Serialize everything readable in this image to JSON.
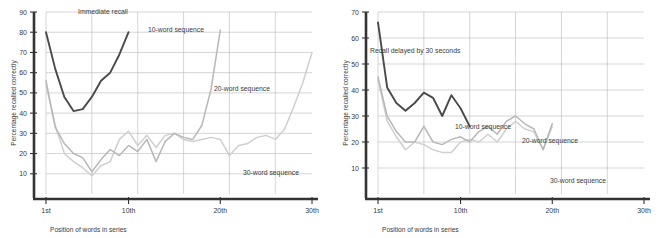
{
  "figure": {
    "background_color": "#ffffff",
    "grid_color": "#b9b9b9",
    "axis_color": "#333333",
    "text_color": "#3b3b3b"
  },
  "series_colors": {
    "ten_word": "#4a4a4a",
    "twenty_word": "#b8b8b8",
    "thirty_word": "#cfcfcf"
  },
  "chart_data": [
    {
      "type": "line",
      "id": "immediate-recall",
      "title": "Immediate recall",
      "xlabel": "Position of words in series",
      "ylabel": "Percentage recalled correctly",
      "xlim": [
        1,
        30
      ],
      "ylim": [
        0,
        90
      ],
      "grid": true,
      "legend_position": "inline-annotations",
      "xticks": [
        1,
        10,
        20,
        30
      ],
      "xticklabels": [
        "1st",
        "10th",
        "20th",
        "30th"
      ],
      "yticks": [
        10,
        20,
        30,
        40,
        50,
        60,
        70,
        80,
        90
      ],
      "yticklabels": [
        "10",
        "20",
        "30",
        "40",
        "50",
        "60",
        "70",
        "80",
        "90"
      ],
      "series": [
        {
          "name": "10-word sequence",
          "color_key": "ten_word",
          "x": [
            1,
            2,
            3,
            4,
            5,
            6,
            7,
            8,
            9,
            10
          ],
          "values": [
            80,
            62,
            48,
            41,
            42,
            48,
            56,
            60,
            69,
            80
          ]
        },
        {
          "name": "20-word sequence",
          "color_key": "twenty_word",
          "x": [
            1,
            2,
            3,
            4,
            5,
            6,
            7,
            8,
            9,
            10,
            11,
            12,
            13,
            14,
            15,
            16,
            17,
            18,
            19,
            20
          ],
          "values": [
            56,
            33,
            25,
            20,
            18,
            11,
            17,
            22,
            19,
            24,
            21,
            27,
            16,
            26,
            30,
            28,
            27,
            34,
            52,
            81
          ]
        },
        {
          "name": "30-word sequence",
          "color_key": "thirty_word",
          "x": [
            1,
            2,
            3,
            4,
            5,
            6,
            7,
            8,
            9,
            10,
            11,
            12,
            13,
            14,
            15,
            16,
            17,
            18,
            19,
            20,
            21,
            22,
            23,
            24,
            25,
            26,
            27,
            28,
            29,
            30
          ],
          "values": [
            54,
            34,
            20,
            16,
            13,
            9,
            14,
            16,
            27,
            31,
            24,
            29,
            23,
            29,
            30,
            27,
            26,
            27,
            28,
            27,
            19,
            24,
            25,
            28,
            29,
            27,
            32,
            43,
            55,
            70
          ]
        }
      ],
      "annotations": [
        {
          "text": "Immediate recall",
          "x_px": 78,
          "y_px": 14
        },
        {
          "text": "10-word sequence",
          "x_px": 148,
          "y_px": 32
        },
        {
          "text": "20-word sequence",
          "x_px": 214,
          "y_px": 91
        },
        {
          "text": "30-word sequence",
          "x_px": 243,
          "y_px": 175
        }
      ]
    },
    {
      "type": "line",
      "id": "delayed-recall",
      "title": "Recall delayed by 30 seconds",
      "xlabel": "Position of words in series",
      "ylabel": "Percentage recalled correctly",
      "xlim": [
        1,
        30
      ],
      "ylim": [
        0,
        70
      ],
      "grid": true,
      "legend_position": "inline-annotations",
      "xticks": [
        1,
        10,
        20,
        30
      ],
      "xticklabels": [
        "1st",
        "10th",
        "20th",
        "30th"
      ],
      "yticks": [
        10,
        20,
        30,
        40,
        50,
        60,
        70
      ],
      "yticklabels": [
        "10",
        "20",
        "30",
        "40",
        "50",
        "60",
        "70"
      ],
      "series": [
        {
          "name": "10-word sequence",
          "color_key": "ten_word",
          "x": [
            1,
            2,
            3,
            4,
            5,
            6,
            7,
            8,
            9,
            10,
            11
          ],
          "values": [
            66,
            41,
            35,
            32,
            35,
            39,
            37,
            30,
            38,
            33,
            26
          ]
        },
        {
          "name": "20-word sequence",
          "color_key": "twenty_word",
          "x": [
            1,
            2,
            3,
            4,
            5,
            6,
            7,
            8,
            9,
            10,
            11,
            12,
            13,
            14,
            15,
            16,
            17,
            18,
            19,
            20
          ],
          "values": [
            45,
            30,
            24,
            20,
            20,
            26,
            20,
            19,
            21,
            22,
            20,
            24,
            26,
            23,
            28,
            30,
            27,
            25,
            17,
            27
          ]
        },
        {
          "name": "30-word sequence",
          "color_key": "thirty_word",
          "x": [
            1,
            2,
            3,
            4,
            5,
            6,
            7,
            8,
            9,
            10,
            11,
            12,
            13,
            14,
            15,
            16,
            17,
            18,
            19,
            20
          ],
          "values": [
            44,
            28,
            22,
            17,
            20,
            19,
            17,
            16,
            16,
            20,
            21,
            20,
            23,
            20,
            25,
            28,
            25,
            24,
            17,
            26
          ]
        }
      ],
      "annotations": [
        {
          "text": "Recall delayed by 30 seconds",
          "x_px": 38,
          "y_px": 53
        },
        {
          "text": "10-word sequence",
          "x_px": 123,
          "y_px": 129
        },
        {
          "text": "20-word sequence",
          "x_px": 190,
          "y_px": 143
        },
        {
          "text": "30-word sequence",
          "x_px": 218,
          "y_px": 183
        }
      ]
    }
  ]
}
